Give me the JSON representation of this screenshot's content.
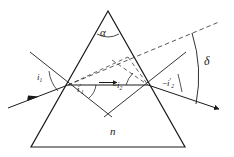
{
  "figure": {
    "medium_label": "n",
    "apex_angle_label": "α",
    "deviation_label": "δ",
    "angles": {
      "incidence_1": {
        "base": "i",
        "sub": "1",
        "prime": "",
        "sign": ""
      },
      "refraction_1": {
        "base": "i",
        "sub": "1",
        "prime": "′",
        "sign": ""
      },
      "incidence_2": {
        "base": "i",
        "sub": "2",
        "prime": "",
        "sign": "−"
      },
      "refraction_2": {
        "base": "i",
        "sub": "2",
        "prime": "′",
        "sign": "−"
      }
    },
    "colors": {
      "stroke": "#1a1a1a",
      "background": "#ffffff",
      "ray": "#2a2a2a",
      "dashed": "#3a3a3a"
    },
    "geometry": {
      "prism": {
        "apex": [
          108,
          11
        ],
        "base_left": [
          31,
          147
        ],
        "base_right": [
          185,
          147
        ]
      },
      "entry_point": [
        68,
        85
      ],
      "exit_point": [
        148,
        85
      ],
      "incident_ray_start": [
        8,
        108
      ],
      "exit_ray_end": [
        219,
        109
      ],
      "deviation_arc": {
        "from": [
          192,
          33
        ],
        "to": [
          196,
          104
        ]
      }
    },
    "elements": {
      "prism_outline": "prism triangle",
      "incident_ray": "incident ray with arrow",
      "internal_ray": "internal horizontal ray with arrow",
      "emergent_ray": "emergent ray with arrow",
      "normal_entry": "surface normal at entry face",
      "normal_exit": "surface normal at exit face",
      "extension_dashed": "dashed extension of incident ray",
      "dashed_internal": "dashed construction lines"
    }
  }
}
